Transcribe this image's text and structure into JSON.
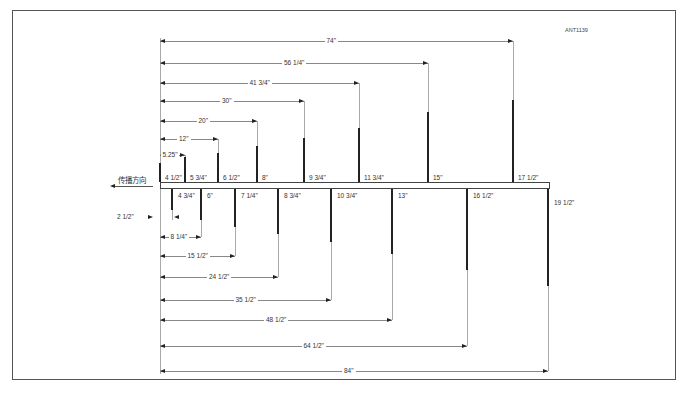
{
  "diagram": {
    "code": "ANT1139",
    "direction_label": "传播方向",
    "caption": "",
    "colors": {
      "line": "#222222",
      "guide": "#aaaaaa",
      "frame": "#555555",
      "background": "#ffffff"
    },
    "upper_dimensions": [
      {
        "label": "74\"",
        "y": 41,
        "x_end": 513
      },
      {
        "label": "56 1/4\"",
        "y": 63,
        "x_end": 428
      },
      {
        "label": "41 3/4\"",
        "y": 83,
        "x_end": 359
      },
      {
        "label": "30\"",
        "y": 101,
        "x_end": 304
      },
      {
        "label": "20\"",
        "y": 121,
        "x_end": 257
      },
      {
        "label": "12\"",
        "y": 139,
        "x_end": 218
      },
      {
        "label": "5.25\"",
        "y": 155,
        "x_end": 185
      }
    ],
    "lower_dimensions": [
      {
        "label": "8 1/4\"",
        "y": 237,
        "x_end": 201
      },
      {
        "label": "15 1/2\"",
        "y": 256,
        "x_end": 235
      },
      {
        "label": "24 1/2\"",
        "y": 277,
        "x_end": 278
      },
      {
        "label": "35 1/2\"",
        "y": 300,
        "x_end": 331
      },
      {
        "label": "48 1/2\"",
        "y": 320,
        "x_end": 392
      },
      {
        "label": "64 1/2\"",
        "y": 346,
        "x_end": 467
      },
      {
        "label": "84\"",
        "y": 371,
        "x_end": 548
      }
    ],
    "offset_dimension": {
      "label": "2 1/2\""
    },
    "upper_elements": [
      {
        "length": "4 1/2\"",
        "x": 160,
        "top": 163
      },
      {
        "length": "5 3/4\"",
        "x": 185,
        "top": 157
      },
      {
        "length": "6 1/2\"",
        "x": 218,
        "top": 153
      },
      {
        "length": "8\"",
        "x": 257,
        "top": 146
      },
      {
        "length": "9 3/4\"",
        "x": 304,
        "top": 138
      },
      {
        "length": "11 3/4\"",
        "x": 359,
        "top": 128
      },
      {
        "length": "15\"",
        "x": 428,
        "top": 112
      },
      {
        "length": "17 1/2\"",
        "x": 513,
        "top": 100
      }
    ],
    "lower_elements": [
      {
        "length": "4 3/4\"",
        "x": 172,
        "bottom": 210
      },
      {
        "length": "6\"",
        "x": 201,
        "bottom": 220
      },
      {
        "length": "7 1/4\"",
        "x": 235,
        "bottom": 227
      },
      {
        "length": "8 3/4\"",
        "x": 278,
        "bottom": 234
      },
      {
        "length": "10 3/4\"",
        "x": 331,
        "bottom": 242
      },
      {
        "length": "13\"",
        "x": 392,
        "bottom": 254
      },
      {
        "length": "16 1/2\"",
        "x": 467,
        "bottom": 270
      },
      {
        "length": "19 1/2\"",
        "x": 548,
        "bottom": 286
      }
    ]
  }
}
